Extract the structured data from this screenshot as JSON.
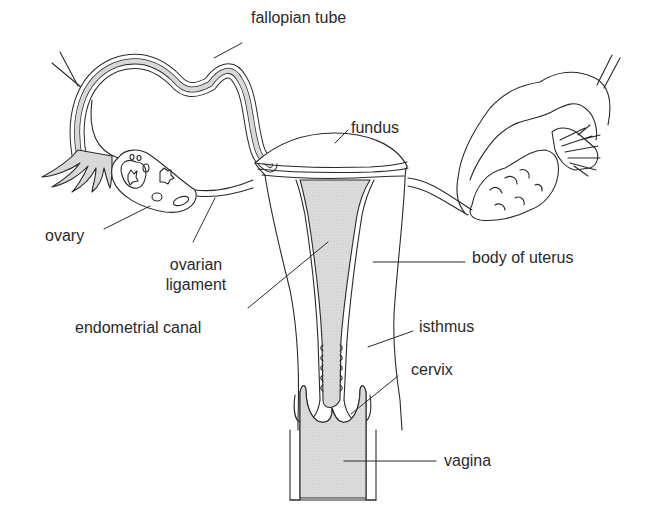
{
  "diagram": {
    "colors": {
      "line": "#2a2a2a",
      "fill_shaded": "#d8d8d8",
      "background": "#ffffff",
      "text": "#2a2a2a"
    },
    "labels": {
      "fallopian_tube": "fallopian tube",
      "fundus": "fundus",
      "ovary": "ovary",
      "ovarian_ligament_1": "ovarian",
      "ovarian_ligament_2": "ligament",
      "endometrial_canal": "endometrial canal",
      "body_of_uterus": "body of uterus",
      "isthmus": "isthmus",
      "cervix": "cervix",
      "vagina": "vagina"
    }
  }
}
